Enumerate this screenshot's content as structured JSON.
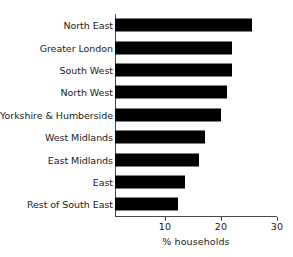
{
  "chart_data": {
    "type": "bar",
    "orientation": "horizontal",
    "title": "",
    "subtitle": "",
    "xlabel": "% households",
    "ylabel": "",
    "categories": [
      "North East",
      "Greater London",
      "South West",
      "North West",
      "Yorkshire & Humberside",
      "West Midlands",
      "East Midlands",
      "East",
      "Rest of South East"
    ],
    "values": [
      25.5,
      22.0,
      22.0,
      21.0,
      20.0,
      17.2,
      16.0,
      13.6,
      12.3
    ],
    "xlim": [
      0,
      30
    ],
    "xticks": [
      10,
      20,
      30
    ],
    "xtick_labels": [
      "10",
      "20",
      "30"
    ],
    "grid": false,
    "legend": false,
    "bar_color": "#000000",
    "axis_color": "#4a4a4a",
    "text_color": "#1a1a1a",
    "background_color": "#ffffff"
  },
  "axis": {
    "x_title": "% households",
    "ticks": [
      {
        "label": "10",
        "value": 10
      },
      {
        "label": "20",
        "value": 20
      },
      {
        "label": "30",
        "value": 30
      }
    ]
  },
  "bars": [
    {
      "label": "North East",
      "value": 25.5
    },
    {
      "label": "Greater London",
      "value": 22.0
    },
    {
      "label": "South West",
      "value": 22.0
    },
    {
      "label": "North West",
      "value": 21.0
    },
    {
      "label": "Yorkshire & Humberside",
      "value": 20.0
    },
    {
      "label": "West Midlands",
      "value": 17.2
    },
    {
      "label": "East Midlands",
      "value": 16.0
    },
    {
      "label": "East",
      "value": 13.6
    },
    {
      "label": "Rest of South East",
      "value": 12.3
    }
  ]
}
